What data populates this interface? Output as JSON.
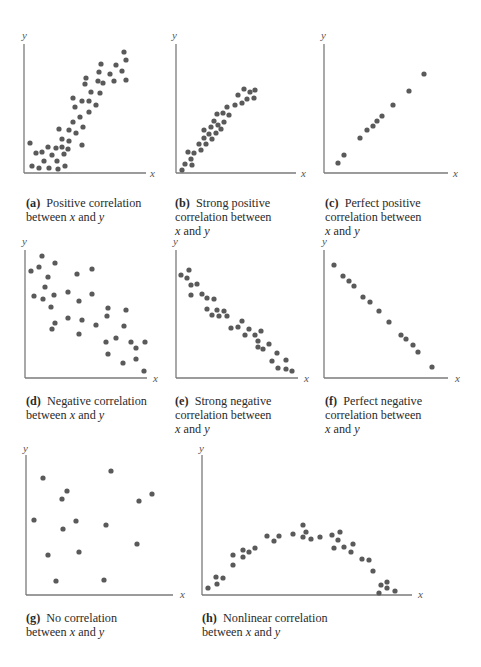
{
  "figure": {
    "dot_color": "#5a5a5a",
    "axis_color": "#7a7a7a",
    "axis_x_label": "x",
    "axis_y_label": "y"
  },
  "panels": [
    {
      "id": "a",
      "tag": "(a)",
      "line1": "Positive correlation",
      "line2": "between",
      "line3": ""
    },
    {
      "id": "b",
      "tag": "(b)",
      "line1": "Strong positive",
      "line2": "correlation between",
      "line3": ""
    },
    {
      "id": "c",
      "tag": "(c)",
      "line1": "Perfect positive",
      "line2": "correlation between",
      "line3": ""
    },
    {
      "id": "d",
      "tag": "(d)",
      "line1": "Negative correlation",
      "line2": "between",
      "line3": ""
    },
    {
      "id": "e",
      "tag": "(e)",
      "line1": "Strong negative",
      "line2": "correlation between",
      "line3": ""
    },
    {
      "id": "f",
      "tag": "(f)",
      "line1": "Perfect negative",
      "line2": "correlation between",
      "line3": ""
    },
    {
      "id": "g",
      "tag": "(g)",
      "line1": "No correlation",
      "line2": "between",
      "line3": ""
    },
    {
      "id": "h",
      "tag": "(h)",
      "line1": "Nonlinear correlation",
      "line2": "between",
      "line3": ""
    }
  ],
  "caption_words": {
    "x": "x",
    "and": "and",
    "y": "y"
  },
  "chart_data": [
    {
      "type": "scatter",
      "title": "(a) Positive correlation between x and y",
      "xlabel": "x",
      "ylabel": "y",
      "grid": false,
      "trend": "positive",
      "axes_px": {
        "ox": 24,
        "oy": 173,
        "top": 44,
        "right": 146,
        "ylab": [
          22,
          39
        ],
        "xlab": [
          150,
          177
        ]
      },
      "points_px": [
        [
          30,
          143
        ],
        [
          36,
          153
        ],
        [
          42,
          152
        ],
        [
          48,
          147
        ],
        [
          56,
          148
        ],
        [
          62,
          147
        ],
        [
          32,
          166
        ],
        [
          39,
          168
        ],
        [
          49,
          168
        ],
        [
          58,
          169
        ],
        [
          65,
          166
        ],
        [
          44,
          161
        ],
        [
          52,
          155
        ],
        [
          57,
          161
        ],
        [
          64,
          154
        ],
        [
          68,
          149
        ],
        [
          62,
          139
        ],
        [
          69,
          141
        ],
        [
          59,
          129
        ],
        [
          69,
          130
        ],
        [
          76,
          133
        ],
        [
          73,
          122
        ],
        [
          80,
          117
        ],
        [
          83,
          127
        ],
        [
          82,
          145
        ],
        [
          75,
          107
        ],
        [
          73,
          98
        ],
        [
          82,
          101
        ],
        [
          89,
          101
        ],
        [
          89,
          112
        ],
        [
          96,
          105
        ],
        [
          91,
          92
        ],
        [
          100,
          93
        ],
        [
          85,
          84
        ],
        [
          86,
          78
        ],
        [
          98,
          81
        ],
        [
          103,
          83
        ],
        [
          99,
          72
        ],
        [
          101,
          64
        ],
        [
          110,
          74
        ],
        [
          114,
          81
        ],
        [
          116,
          65
        ],
        [
          122,
          71
        ],
        [
          126,
          80
        ],
        [
          126,
          60
        ],
        [
          124,
          52
        ]
      ]
    },
    {
      "type": "scatter",
      "title": "(b) Strong positive correlation between x and y",
      "xlabel": "x",
      "ylabel": "y",
      "grid": false,
      "trend": "strong positive",
      "axes_px": {
        "ox": 176,
        "oy": 173,
        "top": 44,
        "right": 296,
        "ylab": [
          172,
          39
        ],
        "xlab": [
          301,
          177
        ]
      },
      "points_px": [
        [
          182,
          170
        ],
        [
          185,
          164
        ],
        [
          192,
          165
        ],
        [
          191,
          159
        ],
        [
          188,
          152
        ],
        [
          194,
          153
        ],
        [
          201,
          150
        ],
        [
          199,
          144
        ],
        [
          206,
          144
        ],
        [
          204,
          138
        ],
        [
          212,
          139
        ],
        [
          209,
          134
        ],
        [
          204,
          130
        ],
        [
          211,
          127
        ],
        [
          216,
          133
        ],
        [
          221,
          129
        ],
        [
          218,
          125
        ],
        [
          214,
          121
        ],
        [
          224,
          122
        ],
        [
          217,
          114
        ],
        [
          223,
          113
        ],
        [
          229,
          115
        ],
        [
          227,
          107
        ],
        [
          235,
          105
        ],
        [
          242,
          103
        ],
        [
          238,
          95
        ],
        [
          247,
          99
        ],
        [
          244,
          89
        ],
        [
          250,
          92
        ],
        [
          255,
          90
        ],
        [
          254,
          98
        ]
      ]
    },
    {
      "type": "scatter",
      "title": "(c) Perfect positive correlation between x and y",
      "xlabel": "x",
      "ylabel": "y",
      "grid": false,
      "trend": "perfect positive",
      "axes_px": {
        "ox": 324,
        "oy": 173,
        "top": 44,
        "right": 448,
        "ylab": [
          321,
          39
        ],
        "xlab": [
          453,
          177
        ]
      },
      "points_px": [
        [
          338,
          163
        ],
        [
          344,
          155
        ],
        [
          360,
          138
        ],
        [
          367,
          130
        ],
        [
          373,
          126
        ],
        [
          377,
          121
        ],
        [
          382,
          116
        ],
        [
          393,
          105
        ],
        [
          409,
          91
        ],
        [
          424,
          74
        ]
      ]
    },
    {
      "type": "scatter",
      "title": "(d) Negative correlation between x and y",
      "xlabel": "x",
      "ylabel": "y",
      "grid": false,
      "trend": "negative",
      "axes_px": {
        "ox": 25,
        "oy": 378,
        "top": 250,
        "right": 147,
        "ylab": [
          22,
          245
        ],
        "xlab": [
          153,
          382
        ]
      },
      "points_px": [
        [
          42,
          256
        ],
        [
          31,
          271
        ],
        [
          39,
          267
        ],
        [
          55,
          263
        ],
        [
          48,
          277
        ],
        [
          45,
          287
        ],
        [
          34,
          296
        ],
        [
          43,
          299
        ],
        [
          54,
          295
        ],
        [
          51,
          307
        ],
        [
          55,
          323
        ],
        [
          52,
          329
        ],
        [
          68,
          292
        ],
        [
          77,
          274
        ],
        [
          92,
          269
        ],
        [
          79,
          301
        ],
        [
          68,
          318
        ],
        [
          82,
          320
        ],
        [
          79,
          334
        ],
        [
          92,
          294
        ],
        [
          96,
          325
        ],
        [
          108,
          308
        ],
        [
          107,
          316
        ],
        [
          126,
          310
        ],
        [
          124,
          326
        ],
        [
          116,
          338
        ],
        [
          106,
          342
        ],
        [
          108,
          354
        ],
        [
          131,
          342
        ],
        [
          136,
          348
        ],
        [
          145,
          342
        ],
        [
          136,
          359
        ],
        [
          123,
          363
        ],
        [
          144,
          371
        ]
      ]
    },
    {
      "type": "scatter",
      "title": "(e) Strong negative correlation between x and y",
      "xlabel": "x",
      "ylabel": "y",
      "grid": false,
      "trend": "strong negative",
      "axes_px": {
        "ox": 176,
        "oy": 378,
        "top": 250,
        "right": 298,
        "ylab": [
          173,
          245
        ],
        "xlab": [
          304,
          382
        ]
      },
      "points_px": [
        [
          181,
          275
        ],
        [
          189,
          270
        ],
        [
          187,
          278
        ],
        [
          191,
          285
        ],
        [
          197,
          284
        ],
        [
          191,
          295
        ],
        [
          202,
          294
        ],
        [
          207,
          298
        ],
        [
          214,
          299
        ],
        [
          207,
          309
        ],
        [
          217,
          310
        ],
        [
          224,
          311
        ],
        [
          212,
          315
        ],
        [
          219,
          316
        ],
        [
          227,
          316
        ],
        [
          231,
          328
        ],
        [
          238,
          327
        ],
        [
          242,
          321
        ],
        [
          249,
          329
        ],
        [
          245,
          335
        ],
        [
          255,
          335
        ],
        [
          261,
          331
        ],
        [
          258,
          341
        ],
        [
          258,
          347
        ],
        [
          263,
          349
        ],
        [
          269,
          344
        ],
        [
          277,
          353
        ],
        [
          272,
          361
        ],
        [
          278,
          368
        ],
        [
          286,
          360
        ],
        [
          286,
          369
        ],
        [
          292,
          371
        ]
      ]
    },
    {
      "type": "scatter",
      "title": "(f) Perfect negative correlation between x and y",
      "xlabel": "x",
      "ylabel": "y",
      "grid": false,
      "trend": "perfect negative",
      "axes_px": {
        "ox": 324,
        "oy": 378,
        "top": 250,
        "right": 448,
        "ylab": [
          322,
          245
        ],
        "xlab": [
          455,
          382
        ]
      },
      "points_px": [
        [
          334,
          265
        ],
        [
          343,
          276
        ],
        [
          349,
          281
        ],
        [
          354,
          286
        ],
        [
          363,
          297
        ],
        [
          370,
          302
        ],
        [
          379,
          311
        ],
        [
          389,
          322
        ],
        [
          401,
          335
        ],
        [
          406,
          339
        ],
        [
          413,
          345
        ],
        [
          418,
          352
        ],
        [
          432,
          367
        ]
      ]
    },
    {
      "type": "scatter",
      "title": "(g) No correlation between x and y",
      "xlabel": "x",
      "ylabel": "y",
      "grid": false,
      "trend": "none",
      "axes_px": {
        "ox": 26,
        "oy": 595,
        "top": 455,
        "right": 173,
        "ylab": [
          23,
          452
        ],
        "xlab": [
          180,
          598
        ]
      },
      "points_px": [
        [
          43,
          478
        ],
        [
          111,
          471
        ],
        [
          67,
          491
        ],
        [
          62,
          499
        ],
        [
          152,
          494
        ],
        [
          139,
          501
        ],
        [
          34,
          520
        ],
        [
          76,
          521
        ],
        [
          63,
          529
        ],
        [
          106,
          525
        ],
        [
          137,
          544
        ],
        [
          48,
          555
        ],
        [
          79,
          552
        ],
        [
          56,
          581
        ],
        [
          104,
          580
        ]
      ]
    },
    {
      "type": "scatter",
      "title": "(h) Nonlinear correlation between x and y",
      "xlabel": "x",
      "ylabel": "y",
      "grid": false,
      "trend": "nonlinear (inverted U)",
      "axes_px": {
        "ox": 202,
        "oy": 595,
        "top": 455,
        "right": 412,
        "ylab": [
          199,
          452
        ],
        "xlab": [
          418,
          598
        ]
      },
      "points_px": [
        [
          208,
          588
        ],
        [
          216,
          577
        ],
        [
          217,
          584
        ],
        [
          223,
          578
        ],
        [
          233,
          555
        ],
        [
          233,
          565
        ],
        [
          243,
          550
        ],
        [
          243,
          557
        ],
        [
          249,
          552
        ],
        [
          255,
          548
        ],
        [
          267,
          536
        ],
        [
          274,
          541
        ],
        [
          279,
          536
        ],
        [
          293,
          534
        ],
        [
          303,
          525
        ],
        [
          306,
          532
        ],
        [
          303,
          537
        ],
        [
          311,
          539
        ],
        [
          320,
          537
        ],
        [
          332,
          535
        ],
        [
          340,
          532
        ],
        [
          338,
          540
        ],
        [
          334,
          548
        ],
        [
          344,
          547
        ],
        [
          353,
          544
        ],
        [
          351,
          552
        ],
        [
          362,
          559
        ],
        [
          369,
          560
        ],
        [
          373,
          571
        ],
        [
          381,
          585
        ],
        [
          387,
          582
        ],
        [
          387,
          588
        ],
        [
          379,
          593
        ],
        [
          395,
          591
        ]
      ]
    }
  ]
}
